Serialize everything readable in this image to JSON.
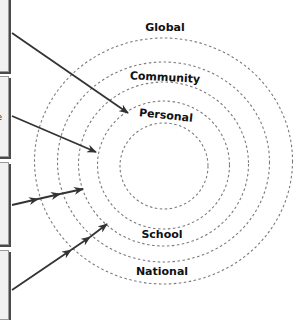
{
  "diagram": {
    "type": "concentric-rings",
    "rings": [
      {
        "label": "Personal",
        "rx": 44,
        "ry": 42
      },
      {
        "label": "School",
        "rx": 66,
        "ry": 63
      },
      {
        "label": "Community",
        "rx": 85,
        "ry": 82
      },
      {
        "label": "National",
        "rx": 106,
        "ry": 100
      },
      {
        "label": "Global",
        "rx": 129,
        "ry": 123
      }
    ],
    "labels": {
      "global": "Global",
      "community": "Community",
      "personal": "Personal",
      "school": "School",
      "national": "National"
    },
    "side_boxes": [
      {
        "fragment": ""
      },
      {
        "fragment": "e"
      },
      {
        "fragment": ""
      },
      {
        "fragment": ""
      }
    ],
    "colors": {
      "ring_stroke": "#7a7a7a",
      "arrow": "#333333",
      "box_fill": "#f1f1f1",
      "box_shadow": "#4a4a4a"
    }
  }
}
